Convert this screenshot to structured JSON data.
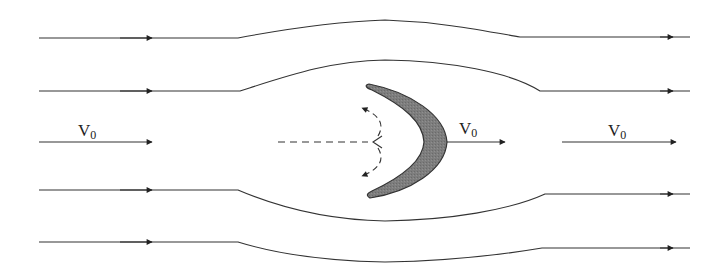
{
  "diagram": {
    "title": "",
    "colors": {
      "stroke": "#333333",
      "body_fill": "#7a7a7a",
      "background": "#ffffff"
    },
    "streamlines": [
      {
        "id": "top-outer",
        "y": 38,
        "deflection": "up",
        "peak_y": 20
      },
      {
        "id": "top-inner",
        "y": 91,
        "deflection": "up",
        "peak_y": 60
      },
      {
        "id": "center",
        "y": 142,
        "deflection": "none"
      },
      {
        "id": "bottom-inner",
        "y": 190,
        "deflection": "down",
        "peak_y": 221
      },
      {
        "id": "bottom-outer",
        "y": 242,
        "deflection": "down",
        "peak_y": 262
      }
    ],
    "labels": [
      {
        "id": "velocity-upstream",
        "symbol": "V",
        "subscript": "0"
      },
      {
        "id": "velocity-body",
        "symbol": "V",
        "subscript": "0"
      },
      {
        "id": "velocity-downstream",
        "symbol": "V",
        "subscript": "0"
      }
    ],
    "body": {
      "shape": "crescent",
      "description": "shaded crescent-shaped body moving right"
    },
    "wake": {
      "style": "dashed",
      "description": "dashed line with curved dashed arrows diverging up and down"
    }
  }
}
